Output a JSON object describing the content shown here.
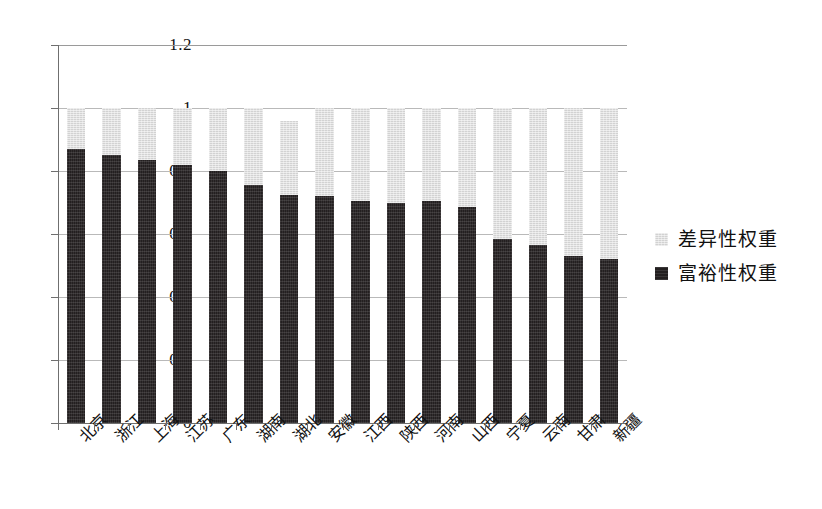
{
  "chart_data": {
    "type": "bar",
    "subtype": "stacked-bar",
    "title": "",
    "xlabel": "",
    "ylabel": "",
    "ylim": [
      0,
      1.2
    ],
    "ytick_labels": [
      "0",
      "0.2",
      "0.4",
      "0.6",
      "0.8",
      "1",
      "1.2"
    ],
    "ytick_values": [
      0,
      0.2,
      0.4,
      0.6,
      0.8,
      1.0,
      1.2
    ],
    "grid": true,
    "legend_position": "right",
    "categories": [
      "北京",
      "浙江",
      "上海",
      "江苏",
      "广东",
      "湖南",
      "湖北",
      "安徽",
      "江西",
      "陕西",
      "河南",
      "山西",
      "宁夏",
      "云南",
      "甘肃",
      "新疆"
    ],
    "series": [
      {
        "name": "富裕性权重",
        "color": "#231f20",
        "values": [
          0.87,
          0.85,
          0.835,
          0.82,
          0.8,
          0.755,
          0.725,
          0.72,
          0.705,
          0.7,
          0.705,
          0.685,
          0.585,
          0.565,
          0.53,
          0.52
        ]
      },
      {
        "name": "差异性权重",
        "color": "#d2d2d2",
        "values": [
          0.13,
          0.15,
          0.165,
          0.18,
          0.2,
          0.245,
          0.235,
          0.28,
          0.295,
          0.3,
          0.295,
          0.315,
          0.415,
          0.435,
          0.47,
          0.48
        ]
      }
    ],
    "totals": [
      1.0,
      1.0,
      1.0,
      1.0,
      1.0,
      1.0,
      0.96,
      1.0,
      1.0,
      1.0,
      1.0,
      1.0,
      1.0,
      1.0,
      1.0,
      1.0
    ]
  },
  "legend": {
    "items": [
      {
        "label": "差异性权重",
        "swatch": "light"
      },
      {
        "label": "富裕性权重",
        "swatch": "dark"
      }
    ]
  }
}
